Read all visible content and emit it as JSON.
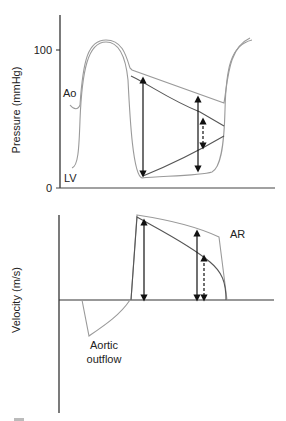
{
  "top_panel": {
    "ylabel": "Pressure (mmHg)",
    "ticks": [
      {
        "label": "100",
        "value": 100
      },
      {
        "label": "0",
        "value": 0
      }
    ],
    "curves": [
      {
        "label": "Ao"
      },
      {
        "label": "LV"
      }
    ]
  },
  "bottom_panel": {
    "ylabel": "Velocity (m/s)",
    "annotations": [
      {
        "label": "AR"
      },
      {
        "label_line1": "Aortic",
        "label_line2": "outflow"
      }
    ]
  },
  "colors": {
    "axis": "#222222",
    "curve_light": "#9a9a9a",
    "curve_dark": "#555555",
    "arrow": "#111111"
  }
}
